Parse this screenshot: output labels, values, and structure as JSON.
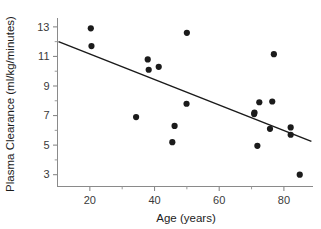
{
  "figure": {
    "width": 321,
    "height": 229,
    "background": "#ffffff",
    "point_color": "#1b1b1b",
    "line_color": "#1a1a1a",
    "axis_color": "#8a8a8a"
  },
  "chart_data": {
    "type": "scatter",
    "title": "",
    "subtitle": "",
    "xlabel": "Age (years)",
    "ylabel": "Plasma Clearance (ml/kg/minutes)",
    "xlim": [
      10,
      89
    ],
    "ylim": [
      2.2,
      13.6
    ],
    "xticks": [
      20,
      40,
      60,
      80
    ],
    "xtick_labels": [
      "20",
      "40",
      "60",
      "80"
    ],
    "xminor_ticks": [
      30,
      50,
      70
    ],
    "yticks": [
      3,
      5,
      7,
      9,
      11,
      13
    ],
    "ytick_labels": [
      "3",
      "5",
      "7",
      "9",
      "11",
      "13"
    ],
    "yminor_ticks": [
      4,
      6,
      8,
      10,
      12
    ],
    "grid": false,
    "legend": null,
    "legend_position": "none",
    "annotations": [],
    "point_marker": "filled-circle",
    "point_radius": 3.1,
    "x": [
      20.3,
      20.5,
      34.3,
      37.9,
      38.2,
      41.3,
      45.5,
      46.2,
      49.9,
      50.0,
      70.8,
      70.9,
      71.8,
      72.4,
      75.7,
      76.4,
      76.9,
      82.1,
      82.1,
      84.9
    ],
    "y": [
      12.9,
      11.7,
      6.9,
      10.8,
      10.1,
      10.3,
      5.2,
      6.3,
      7.8,
      12.6,
      7.1,
      7.2,
      4.95,
      7.9,
      6.1,
      7.95,
      11.15,
      6.2,
      5.7,
      3.0
    ],
    "series": [
      {
        "name": "Subjects",
        "points": [
          {
            "x": 20.3,
            "y": 12.9
          },
          {
            "x": 20.5,
            "y": 11.7
          },
          {
            "x": 34.3,
            "y": 6.9
          },
          {
            "x": 37.9,
            "y": 10.8
          },
          {
            "x": 38.2,
            "y": 10.1
          },
          {
            "x": 41.3,
            "y": 10.3
          },
          {
            "x": 45.5,
            "y": 5.2
          },
          {
            "x": 46.2,
            "y": 6.3
          },
          {
            "x": 49.9,
            "y": 7.8
          },
          {
            "x": 50.0,
            "y": 12.6
          },
          {
            "x": 70.8,
            "y": 7.1
          },
          {
            "x": 70.9,
            "y": 7.2
          },
          {
            "x": 71.8,
            "y": 4.95
          },
          {
            "x": 72.4,
            "y": 7.9
          },
          {
            "x": 75.7,
            "y": 6.1
          },
          {
            "x": 76.4,
            "y": 7.95
          },
          {
            "x": 76.9,
            "y": 11.15
          },
          {
            "x": 82.1,
            "y": 6.2
          },
          {
            "x": 82.1,
            "y": 5.7
          },
          {
            "x": 84.9,
            "y": 3.0
          }
        ]
      }
    ],
    "trend_line": {
      "name": "Regression line",
      "x_start": 10.3,
      "y_start": 12.0,
      "x_end": 88.5,
      "y_end": 5.25
    }
  }
}
